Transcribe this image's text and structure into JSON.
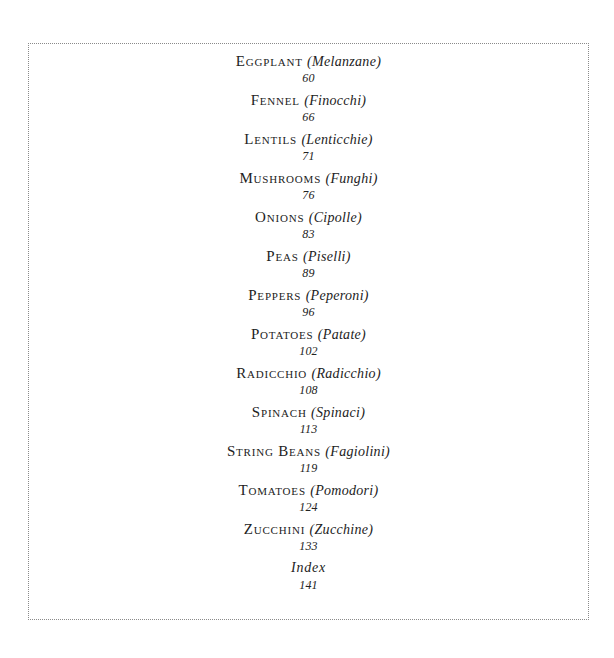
{
  "toc": {
    "entries": [
      {
        "english": "Eggplant",
        "italian": "(Melanzane)",
        "page": "60"
      },
      {
        "english": "Fennel",
        "italian": "(Finocchi)",
        "page": "66"
      },
      {
        "english": "Lentils",
        "italian": "(Lenticchie)",
        "page": "71"
      },
      {
        "english": "Mushrooms",
        "italian": "(Funghi)",
        "page": "76"
      },
      {
        "english": "Onions",
        "italian": "(Cipolle)",
        "page": "83"
      },
      {
        "english": "Peas",
        "italian": "(Piselli)",
        "page": "89"
      },
      {
        "english": "Peppers",
        "italian": "(Peperoni)",
        "page": "96"
      },
      {
        "english": "Potatoes",
        "italian": "(Patate)",
        "page": "102"
      },
      {
        "english": "Radicchio",
        "italian": "(Radicchio)",
        "page": "108"
      },
      {
        "english": "Spinach",
        "italian": "(Spinaci)",
        "page": "113"
      },
      {
        "english": "String Beans",
        "italian": "(Fagiolini)",
        "page": "119"
      },
      {
        "english": "Tomatoes",
        "italian": "(Pomodori)",
        "page": "124"
      },
      {
        "english": "Zucchini",
        "italian": "(Zucchine)",
        "page": "133"
      }
    ],
    "index": {
      "label": "Index",
      "page": "141"
    }
  }
}
